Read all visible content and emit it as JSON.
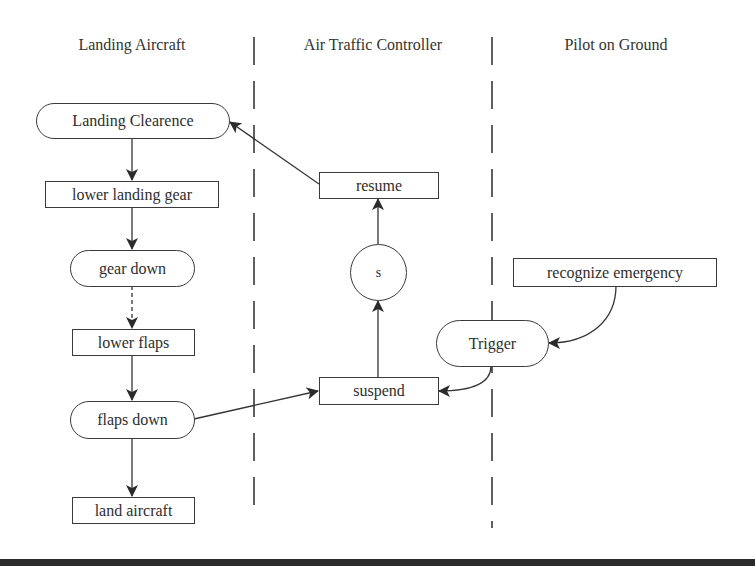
{
  "diagram": {
    "type": "swimlane-activity-diagram",
    "lanes": [
      {
        "id": "landing-aircraft",
        "title": "Landing Aircraft"
      },
      {
        "id": "air-traffic-controller",
        "title": "Air Traffic Controller"
      },
      {
        "id": "pilot-on-ground",
        "title": "Pilot on Ground"
      }
    ],
    "nodes": {
      "landing_clearence": {
        "label": "Landing Clearence",
        "shape": "pill",
        "lane": "landing-aircraft"
      },
      "lower_landing_gear": {
        "label": "lower landing gear",
        "shape": "rect",
        "lane": "landing-aircraft"
      },
      "gear_down": {
        "label": "gear down",
        "shape": "pill",
        "lane": "landing-aircraft"
      },
      "lower_flaps": {
        "label": "lower flaps",
        "shape": "rect",
        "lane": "landing-aircraft"
      },
      "flaps_down": {
        "label": "flaps down",
        "shape": "pill",
        "lane": "landing-aircraft"
      },
      "land_aircraft": {
        "label": "land aircraft",
        "shape": "rect",
        "lane": "landing-aircraft"
      },
      "resume": {
        "label": "resume",
        "shape": "rect",
        "lane": "air-traffic-controller"
      },
      "s": {
        "label": "s",
        "shape": "circle",
        "lane": "air-traffic-controller"
      },
      "suspend": {
        "label": "suspend",
        "shape": "rect",
        "lane": "air-traffic-controller"
      },
      "recognize_emergency": {
        "label": "recognize emergency",
        "shape": "rect",
        "lane": "pilot-on-ground"
      },
      "trigger": {
        "label": "Trigger",
        "shape": "pill",
        "lane": "pilot-on-ground"
      }
    },
    "edges": [
      {
        "from": "landing_clearence",
        "to": "lower_landing_gear",
        "style": "solid"
      },
      {
        "from": "lower_landing_gear",
        "to": "gear_down",
        "style": "solid"
      },
      {
        "from": "gear_down",
        "to": "lower_flaps",
        "style": "dashed"
      },
      {
        "from": "lower_flaps",
        "to": "flaps_down",
        "style": "solid"
      },
      {
        "from": "flaps_down",
        "to": "land_aircraft",
        "style": "solid"
      },
      {
        "from": "flaps_down",
        "to": "suspend",
        "style": "solid"
      },
      {
        "from": "suspend",
        "to": "s",
        "style": "solid"
      },
      {
        "from": "s",
        "to": "resume",
        "style": "solid"
      },
      {
        "from": "resume",
        "to": "landing_clearence",
        "style": "solid"
      },
      {
        "from": "recognize_emergency",
        "to": "trigger",
        "style": "solid-curved"
      },
      {
        "from": "trigger",
        "to": "suspend",
        "style": "solid-curved"
      }
    ]
  },
  "colors": {
    "line": "#3a3a3a",
    "background": "#ffffff",
    "bottom_bar": "#2b2b2b"
  }
}
